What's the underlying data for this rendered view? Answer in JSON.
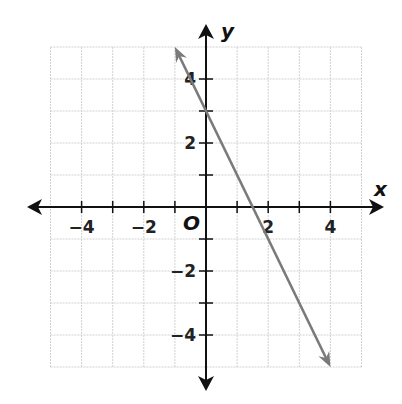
{
  "chart_data": {
    "type": "line",
    "title": "",
    "xlabel": "x",
    "ylabel": "y",
    "origin_label": "O",
    "xlim": [
      -5,
      5
    ],
    "ylim": [
      -5,
      5
    ],
    "grid": true,
    "x_ticks": [
      -4,
      -3,
      -2,
      -1,
      1,
      2,
      3,
      4
    ],
    "y_ticks": [
      -4,
      -3,
      -2,
      -1,
      1,
      2,
      3,
      4
    ],
    "x_tick_labels": [
      "−4",
      "−2",
      "2",
      "4"
    ],
    "y_tick_labels": [
      "4",
      "2",
      "−2",
      "−4"
    ],
    "series": [
      {
        "name": "line",
        "equation": "y = -2x + 3",
        "slope": -2,
        "intercept": 3,
        "x": [
          -1,
          4
        ],
        "y": [
          5,
          -5
        ],
        "arrows": "both",
        "color": "#7a7a7a"
      }
    ]
  },
  "colors": {
    "axis": "#111111",
    "grid": "#d0d0d0",
    "line": "#7a7a7a"
  }
}
